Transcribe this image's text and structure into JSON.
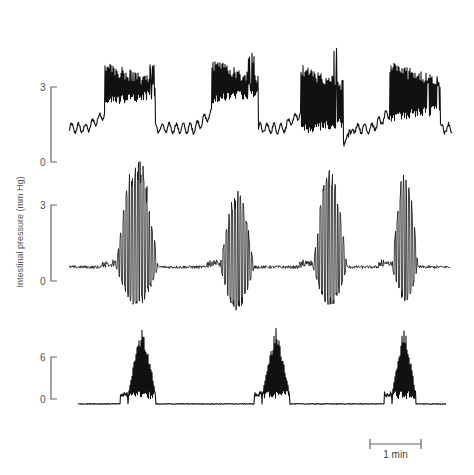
{
  "chart_data": {
    "type": "line",
    "title": "",
    "ylabel": "Intestinal pressure (mm Hg)",
    "xlabel": "",
    "time_scale_bar": {
      "label": "1 min",
      "x_start_px": 370,
      "x_end_px": 421
    },
    "grid": false,
    "legend": null,
    "panels": [
      {
        "name": "top",
        "y_ticks": [
          0,
          3
        ],
        "y_tick_labels": [
          "0",
          "3"
        ],
        "ylim": [
          0,
          3
        ],
        "y_px": {
          "zero": 162,
          "max": 87
        },
        "x_range_px": [
          69,
          452
        ],
        "baseline_mmHg": 1.35,
        "baseline_ripple_mmHg": 0.18,
        "bursts": [
          {
            "center_px": 130,
            "width_px": 50,
            "plateau_mmHg": 2.9,
            "spike_max_mmHg": 4.0,
            "trough_mmHg": 1.6
          },
          {
            "center_px": 235,
            "width_px": 46,
            "plateau_mmHg": 3.0,
            "spike_max_mmHg": 4.4,
            "trough_mmHg": 1.7
          },
          {
            "center_px": 322,
            "width_px": 42,
            "plateau_mmHg": 2.8,
            "spike_max_mmHg": 4.6,
            "trough_mmHg": 0.5
          },
          {
            "center_px": 415,
            "width_px": 50,
            "plateau_mmHg": 2.9,
            "spike_max_mmHg": 3.7,
            "trough_mmHg": 1.0
          }
        ]
      },
      {
        "name": "middle",
        "y_ticks": [
          0,
          3
        ],
        "y_tick_labels": [
          "0",
          "3"
        ],
        "ylim": [
          0,
          3
        ],
        "y_px": {
          "zero": 281,
          "max": 205
        },
        "x_range_px": [
          69,
          450
        ],
        "baseline_mmHg": 0.55,
        "baseline_ripple_mmHg": 0.06,
        "bursts": [
          {
            "center_px": 137,
            "width_px": 42,
            "peak_mmHg": 5.0,
            "trough_mmHg": -1.0
          },
          {
            "center_px": 237,
            "width_px": 34,
            "peak_mmHg": 3.6,
            "trough_mmHg": -1.2
          },
          {
            "center_px": 330,
            "width_px": 34,
            "peak_mmHg": 4.4,
            "trough_mmHg": -1.0
          },
          {
            "center_px": 405,
            "width_px": 26,
            "peak_mmHg": 4.4,
            "trough_mmHg": -0.8
          }
        ]
      },
      {
        "name": "bottom",
        "y_ticks": [
          0,
          6
        ],
        "y_tick_labels": [
          "0",
          "6"
        ],
        "ylim": [
          0,
          6
        ],
        "y_px": {
          "zero": 399,
          "max": 357
        },
        "x_range_px": [
          78,
          446
        ],
        "baseline_mmHg": -1.2,
        "baseline_ripple_mmHg": 0.1,
        "bursts": [
          {
            "center_px": 142,
            "width_px": 28,
            "peak_mmHg": 10.5,
            "floor_mmHg": 0.0
          },
          {
            "center_px": 276,
            "width_px": 28,
            "peak_mmHg": 10.2,
            "floor_mmHg": 0.0
          },
          {
            "center_px": 404,
            "width_px": 24,
            "peak_mmHg": 10.5,
            "floor_mmHg": 0.0
          }
        ]
      }
    ]
  }
}
